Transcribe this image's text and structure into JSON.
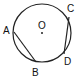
{
  "diagram": {
    "type": "circle-geometry",
    "center": {
      "label": "O",
      "x": 42,
      "y": 33
    },
    "radius": 29,
    "points": [
      {
        "label": "A",
        "x": 14,
        "y": 32,
        "lx": 3,
        "ly": 34
      },
      {
        "label": "B",
        "x": 36,
        "y": 62,
        "lx": 32,
        "ly": 76
      },
      {
        "label": "C",
        "x": 69,
        "y": 17,
        "lx": 67,
        "ly": 13
      },
      {
        "label": "D",
        "x": 64,
        "y": 54,
        "lx": 64,
        "ly": 65
      }
    ],
    "chords": [
      [
        "A",
        "B"
      ],
      [
        "C",
        "D"
      ]
    ],
    "colors": {
      "stroke": "#222222",
      "text": "#111111"
    }
  }
}
